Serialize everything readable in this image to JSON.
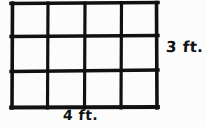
{
  "diagram": {
    "background_color": "#fcfcfc",
    "stroke_color": "#111111",
    "rectangle": {
      "columns": 4,
      "rows": 3,
      "total_cells": 12,
      "left_px": 11,
      "top_px": 3,
      "right_px": 158,
      "bottom_px": 108,
      "vertical_line_x": [
        11,
        48,
        85,
        121,
        158
      ],
      "horizontal_line_y": [
        3,
        36,
        71,
        108
      ]
    },
    "labels": {
      "height_label": "3 ft.",
      "width_label": "4 ft."
    }
  }
}
